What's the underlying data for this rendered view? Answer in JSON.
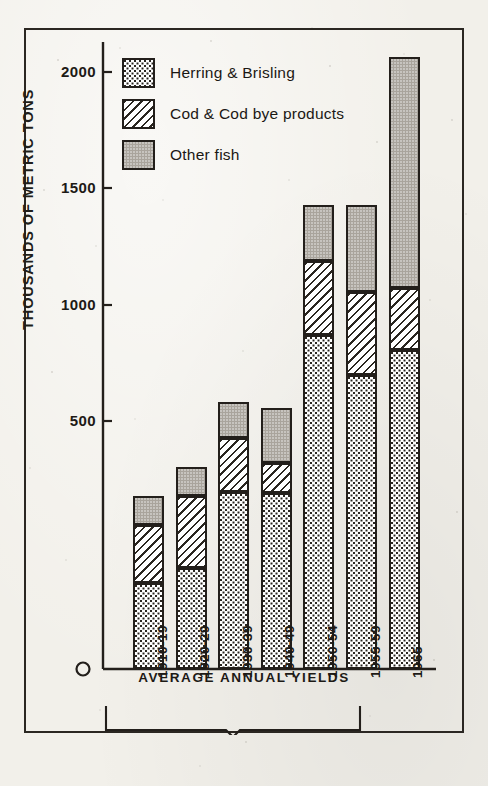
{
  "chart_data": {
    "type": "bar",
    "stacked": true,
    "title": "",
    "xlabel": "AVERAGE ANNUAL YIELDS",
    "ylabel": "THOUSANDS OF METRIC TONS",
    "categories": [
      "1910-19",
      "1920-29",
      "1930-39",
      "1940-49",
      "1950-54",
      "1955-59",
      "1965"
    ],
    "series": [
      {
        "name": "Herring & Brisling",
        "pattern": "dots",
        "values": [
          288,
          338,
          593,
          590,
          1120,
          985,
          1069
        ]
      },
      {
        "name": "Cod & Cod bye products",
        "pattern": "hatch",
        "values": [
          195,
          242,
          181,
          100,
          248,
          279,
          207
        ]
      },
      {
        "name": "Other fish",
        "pattern": "solid",
        "values": [
          97,
          97,
          120,
          184,
          187,
          291,
          774
        ]
      }
    ],
    "totals": [
      580,
      677,
      894,
      874,
      1555,
      1555,
      2050
    ],
    "ylim": [
      0,
      2150
    ],
    "yticks": [
      500,
      1000,
      1500,
      2000
    ],
    "ytick_labels": [
      "500",
      "1000",
      "1500",
      "2000"
    ],
    "zero_label": "0",
    "grid": false,
    "legend_position": "top-left"
  },
  "legend": {
    "items": [
      {
        "label": "Herring & Brisling",
        "pattern": "dots"
      },
      {
        "label": "Cod & Cod bye products",
        "pattern": "hatch"
      },
      {
        "label": "Other fish",
        "pattern": "solid"
      }
    ]
  },
  "axis": {
    "y_title": "THOUSANDS OF METRIC TONS",
    "x_title": "AVERAGE ANNUAL YIELDS"
  }
}
